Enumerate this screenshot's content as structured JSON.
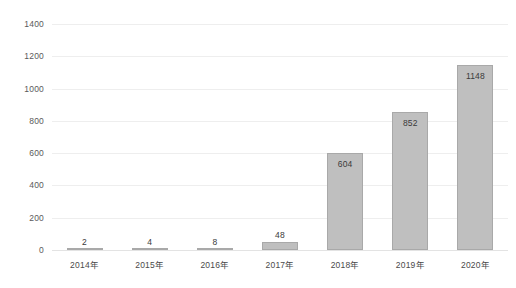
{
  "chart_data": {
    "type": "bar",
    "title": "",
    "subtitle": "",
    "xlabel": "",
    "ylabel": "",
    "categories": [
      "2014年",
      "2015年",
      "2016年",
      "2017年",
      "2018年",
      "2019年",
      "2020年"
    ],
    "values": [
      2,
      4,
      8,
      48,
      604,
      852,
      1148
    ],
    "value_labels": [
      "2",
      "4",
      "8",
      "48",
      "604",
      "852",
      "1148"
    ],
    "ylim": [
      0,
      1400
    ],
    "ytick_values": [
      0,
      200,
      400,
      600,
      800,
      1000,
      1200,
      1400
    ],
    "ytick_labels": [
      "0",
      "200",
      "400",
      "600",
      "800",
      "1000",
      "1200",
      "1400"
    ],
    "grid": true,
    "grid_axis": "y",
    "legend": false,
    "legend_position": "none",
    "series": [
      {
        "name": "",
        "values": [
          2,
          4,
          8,
          48,
          604,
          852,
          1148
        ]
      }
    ],
    "colors": {
      "bar_fill": "#bfbfbf",
      "bar_border": "#a9a9a9",
      "gridline": "#eeeeee",
      "baseline": "#e3e3e3",
      "tick_text": "#5a5a5a",
      "value_text": "#3a3a3a",
      "background": "#ffffff"
    }
  }
}
